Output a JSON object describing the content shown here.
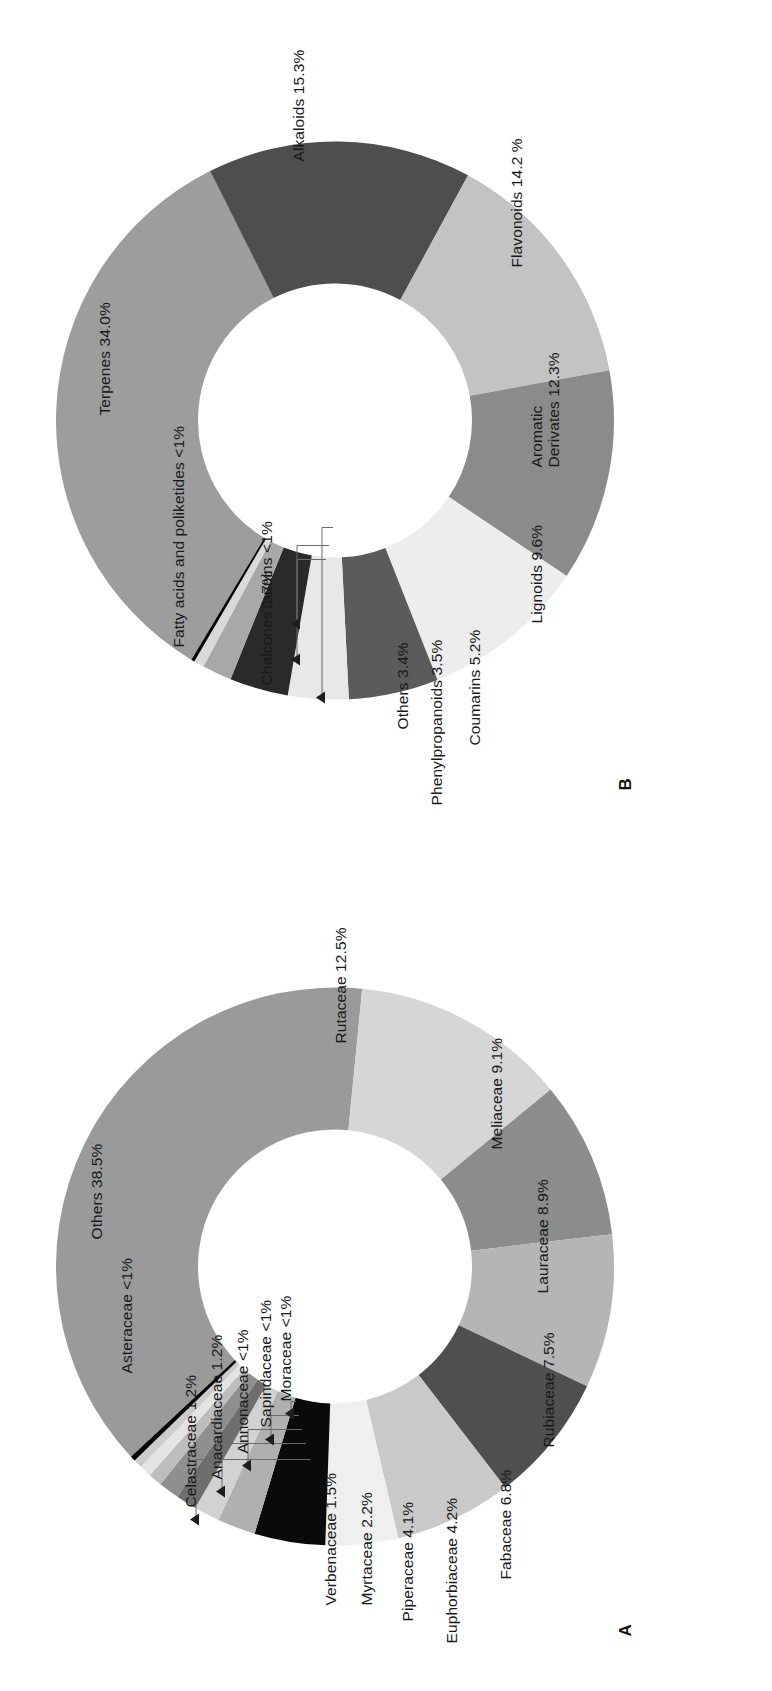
{
  "figure": {
    "panels": [
      {
        "id": "A",
        "letter": "A",
        "caption_kind": "plant-families"
      },
      {
        "id": "B",
        "letter": "B",
        "caption_kind": "compound-classes"
      }
    ]
  },
  "chart_data": [
    {
      "panel": "A",
      "type": "pie",
      "variant": "donut",
      "title": "",
      "legend": "outside-labels",
      "categories": [
        "Others 38.5%",
        "Rutaceae 12.5%",
        "Meliaceae 9.1%",
        "Lauraceae 8.9%",
        "Rubiaceae 7.5%",
        "Fabaceae 6.8%",
        "Euphorbiaceae 4.2%",
        "Piperaceae 4.1%",
        "Myrtaceae 2.2%",
        "Verbenaceae 1.5%",
        "Celastraceae 1.2%",
        "Anacardiaceae 1.2%",
        "Annonaceae <1%",
        "Sapindaceae <1%",
        "Moraceae <1%",
        "Asteraceae <1%"
      ],
      "labels": [
        "Others 38.5%",
        "Rutaceae 12.5%",
        "Meliaceae 9.1%",
        "Lauraceae 8.9%",
        "Rubiaceae 7.5%",
        "Fabaceae 6.8%",
        "Euphorbiaceae 4.2%",
        "Piperaceae 4.1%",
        "Myrtaceae 2.2%",
        "Verbenaceae 1.5%",
        "Celastraceae 1.2%",
        "Anacardiaceae 1.2%",
        "Annonaceae <1%",
        "Sapindaceae <1%",
        "Moraceae <1%",
        "Asteraceae <1%"
      ],
      "names": [
        "Others",
        "Rutaceae",
        "Meliaceae",
        "Lauraceae",
        "Rubiaceae",
        "Fabaceae",
        "Euphorbiaceae",
        "Piperaceae",
        "Myrtaceae",
        "Verbenaceae",
        "Celastraceae",
        "Anacardiaceae",
        "Annonaceae",
        "Sapindaceae",
        "Moraceae",
        "Asteraceae"
      ],
      "values": [
        38.5,
        12.5,
        9.1,
        8.9,
        7.5,
        6.8,
        4.2,
        4.1,
        2.2,
        1.5,
        1.2,
        1.2,
        0.8,
        0.7,
        0.5,
        0.3
      ],
      "value_texts": [
        "38.5%",
        "12.5%",
        "9.1%",
        "8.9%",
        "7.5%",
        "6.8%",
        "4.2%",
        "4.1%",
        "2.2%",
        "1.5%",
        "1.2%",
        "1.2%",
        "<1%",
        "<1%",
        "<1%",
        "<1%"
      ],
      "colors": [
        "#9a9a9a",
        "#d6d6d6",
        "#8c8c8c",
        "#b5b5b5",
        "#4f4f4f",
        "#c9c9c9",
        "#efefef",
        "#0a0a0a",
        "#b0b0b0",
        "#d2d2d2",
        "#6e6e6e",
        "#8f8f8f",
        "#bdbdbd",
        "#e4e4e4",
        "#cccccc",
        "#050505"
      ]
    },
    {
      "panel": "B",
      "type": "pie",
      "variant": "donut",
      "title": "",
      "legend": "outside-labels",
      "categories": [
        "Terpenes 34.0%",
        "Alkaloids 15.3%",
        "Flavonoids 14.2 %",
        "Aromatic Derivates 12.3%",
        "Lignoids 9.6%",
        "Coumarins 5.2%",
        "Phenylpropanoids 3.5%",
        "Others 3.4%",
        "Chalcones 1.7%",
        "Fatty acids and poliketides <1%",
        "Tannins <1%"
      ],
      "labels": [
        "Terpenes 34.0%",
        "Alkaloids 15.3%",
        "Flavonoids 14.2 %",
        "Aromatic Derivates 12.3%",
        "Lignoids 9.6%",
        "Coumarins 5.2%",
        "Phenylpropanoids 3.5%",
        "Others 3.4%",
        "Chalcones 1.7%",
        "Fatty acids and poliketides <1%",
        "Tannins <1%"
      ],
      "names": [
        "Terpenes",
        "Alkaloids",
        "Flavonoids",
        "Aromatic Derivates",
        "Lignoids",
        "Coumarins",
        "Phenylpropanoids",
        "Others",
        "Chalcones",
        "Fatty acids and poliketides",
        "Tannins"
      ],
      "values": [
        34.0,
        15.3,
        14.2,
        12.3,
        9.6,
        5.2,
        3.5,
        3.4,
        1.7,
        0.6,
        0.2
      ],
      "value_texts": [
        "34.0%",
        "15.3%",
        "14.2 %",
        "12.3%",
        "9.6%",
        "5.2%",
        "3.5%",
        "3.4%",
        "1.7%",
        "<1%",
        "<1%"
      ],
      "colors": [
        "#9d9d9d",
        "#4e4e4e",
        "#c3c3c3",
        "#8b8b8b",
        "#ededed",
        "#5b5b5b",
        "#e8e8e8",
        "#2a2a2a",
        "#a8a8a8",
        "#d9d9d9",
        "#000000"
      ]
    }
  ],
  "panel_a": {
    "letter": "A",
    "label_0": "Others 38.5%",
    "label_1": "Rutaceae 12.5%",
    "label_2": "Meliaceae 9.1%",
    "label_3": "Lauraceae 8.9%",
    "label_4": "Rubiaceae 7.5%",
    "label_5": "Fabaceae 6.8%",
    "label_6": "Euphorbiaceae 4.2%",
    "label_7": "Piperaceae 4.1%",
    "label_8": "Myrtaceae 2.2%",
    "label_9": "Verbenaceae 1.5%",
    "label_10": "Celastraceae 1.2%",
    "label_11": "Anacardiaceae 1.2%",
    "label_12": "Annonaceae <1%",
    "label_13": "Sapindaceae <1%",
    "label_14": "Moraceae <1%",
    "label_15": "Asteraceae <1%"
  },
  "panel_b": {
    "letter": "B",
    "label_0": "Terpenes 34.0%",
    "label_1": "Alkaloids 15.3%",
    "label_2": "Flavonoids 14.2 %",
    "label_3_line1": "Aromatic",
    "label_3_line2": "Derivates 12.3%",
    "label_4": "Lignoids 9.6%",
    "label_5": "Coumarins 5.2%",
    "label_6": "Phenylpropanoids 3.5%",
    "label_7": "Others 3.4%",
    "label_8": "Chalcones 1.7%",
    "label_9": "Fatty acids and poliketides <1%",
    "label_10": "Tannins <1%"
  }
}
